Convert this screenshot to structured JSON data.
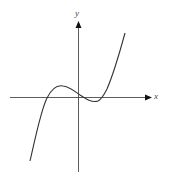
{
  "diagram": {
    "type": "cubic-function-graph",
    "x_axis_label": "x",
    "y_axis_label": "y",
    "curve": {
      "description": "cubic with local max left of y-axis and local min right of y-axis",
      "x_intercepts": 3,
      "color": "#333333"
    },
    "axis_color": "#333333"
  }
}
